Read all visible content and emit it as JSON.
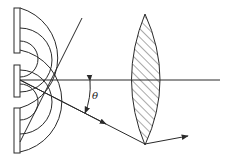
{
  "diagram": {
    "labels": {
      "angle": "θ"
    },
    "colors": {
      "stroke": "#2a2a2a",
      "background": "#ffffff"
    },
    "elements": [
      "barrier-top",
      "barrier-middle",
      "barrier-bottom",
      "slit-upper",
      "slit-lower",
      "wavefronts",
      "optical-axis",
      "diffracted-ray",
      "converging-lens",
      "focused-ray"
    ]
  }
}
